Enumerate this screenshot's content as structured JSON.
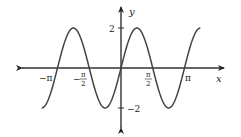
{
  "chart_data": {
    "type": "line",
    "title": "",
    "function": "y = 2 sin(2x)",
    "xlabel": "x",
    "ylabel": "y",
    "xlim": [
      -3.927,
      3.927
    ],
    "ylim": [
      -2,
      2
    ],
    "x_ticks": [
      {
        "value": -3.14159,
        "label": "−π"
      },
      {
        "value": -1.5708,
        "label": "−π/2"
      },
      {
        "value": 1.5708,
        "label": "π/2"
      },
      {
        "value": 3.14159,
        "label": "π"
      }
    ],
    "y_ticks": [
      {
        "value": 2,
        "label": "2"
      },
      {
        "value": -2,
        "label": "−2"
      }
    ],
    "series": [
      {
        "name": "2sin(2x)",
        "x": [
          -3.927,
          -3.534,
          -3.1416,
          -2.7489,
          -2.3562,
          -1.9635,
          -1.5708,
          -1.1781,
          -0.7854,
          -0.3927,
          0,
          0.3927,
          0.7854,
          1.1781,
          1.5708,
          1.9635,
          2.3562,
          2.7489,
          3.1416,
          3.534,
          3.927
        ],
        "values": [
          -2,
          -1.414,
          0,
          1.414,
          2,
          1.414,
          0,
          -1.414,
          -2,
          -1.414,
          0,
          1.414,
          2,
          1.414,
          0,
          -1.414,
          -2,
          -1.414,
          0,
          1.414,
          2
        ]
      }
    ],
    "grid": false,
    "legend": null
  },
  "labels": {
    "x_axis": "x",
    "y_axis": "y",
    "y_top": "2",
    "y_bottom": "−2",
    "x_neg_pi": "−π",
    "x_pi": "π",
    "half_num": "π",
    "half_den": "2",
    "minus": "−"
  }
}
